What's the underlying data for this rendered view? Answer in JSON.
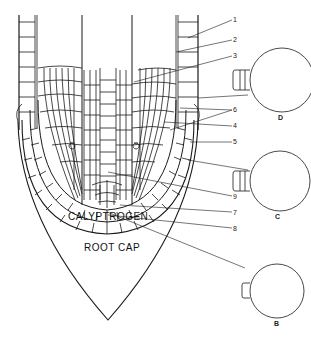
{
  "figure": {
    "type": "root tip longitudinal section",
    "region_labels": {
      "calyptrogen": "CALYPTROGEN",
      "root_cap": "ROOT CAP"
    },
    "numbered_labels": [
      {
        "id": "1",
        "text": "1"
      },
      {
        "id": "2",
        "text": "2"
      },
      {
        "id": "3",
        "text": "3"
      },
      {
        "id": "6",
        "text": "6"
      },
      {
        "id": "4",
        "text": "4"
      },
      {
        "id": "5",
        "text": "5"
      },
      {
        "id": "9",
        "text": "9"
      },
      {
        "id": "7",
        "text": "7"
      },
      {
        "id": "8",
        "text": "8"
      }
    ],
    "insets": [
      {
        "id": "D",
        "label": "D"
      },
      {
        "id": "C",
        "label": "C"
      },
      {
        "id": "B",
        "label": "B"
      }
    ],
    "line_color": "#1a1a1a",
    "background": "#ffffff"
  }
}
